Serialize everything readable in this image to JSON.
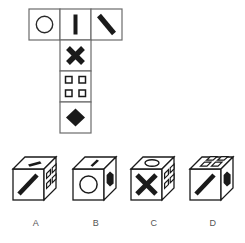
{
  "puzzle": {
    "type": "cube-net-folding",
    "net": {
      "name": "t-shaped-cube-net",
      "layout": "T",
      "cell_size": 31,
      "origin": {
        "x": 29,
        "y": 9
      },
      "stroke": "#6b6b6b",
      "fill": "#ffffff",
      "cells": [
        {
          "id": "net-cell-circle",
          "row": 0,
          "col": 0,
          "face_symbol": "circle",
          "filled": false
        },
        {
          "id": "net-cell-vertical-bar",
          "row": 0,
          "col": 1,
          "face_symbol": "vertical-bar",
          "filled": true
        },
        {
          "id": "net-cell-diagonal-bar",
          "row": 0,
          "col": 2,
          "face_symbol": "diagonal-bar-backslash",
          "filled": true
        },
        {
          "id": "net-cell-cross",
          "row": 1,
          "col": 1,
          "face_symbol": "cross-x",
          "filled": true
        },
        {
          "id": "net-cell-four-squares",
          "row": 2,
          "col": 1,
          "face_symbol": "four-small-squares",
          "filled": false
        },
        {
          "id": "net-cell-diamond",
          "row": 3,
          "col": 1,
          "face_symbol": "filled-diamond",
          "filled": true
        }
      ]
    },
    "options": [
      {
        "id": "option-a",
        "label": "A",
        "faces": {
          "front": "diagonal-bar-slash",
          "top": "short-thick-bar",
          "right": "four-small-squares"
        }
      },
      {
        "id": "option-b",
        "label": "B",
        "faces": {
          "front": "circle",
          "top": "short-thick-bar",
          "right": "filled-diamond"
        }
      },
      {
        "id": "option-c",
        "label": "C",
        "faces": {
          "front": "cross-x",
          "top": "ellipse",
          "right": "four-small-squares"
        }
      },
      {
        "id": "option-d",
        "label": "D",
        "faces": {
          "front": "diagonal-bar-slash",
          "top": "four-small-squares",
          "right": "filled-diamond"
        }
      }
    ],
    "colors": {
      "ink": "#1a1a1a",
      "net_stroke": "#6b6b6b",
      "cube_stroke": "#1a1a1a",
      "label_text": "#555555",
      "background": "#ffffff"
    }
  }
}
